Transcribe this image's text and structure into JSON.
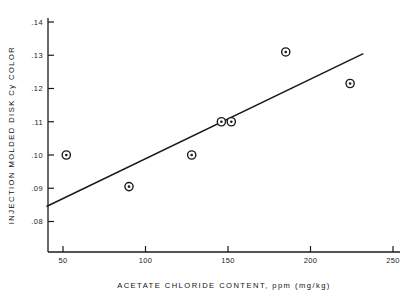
{
  "chart_data": {
    "type": "scatter",
    "title": "",
    "xlabel": "ACETATE CHLORIDE CONTENT, ppm (mg/kg)",
    "ylabel": "INJECTION MOLDED DISK Cy COLOR",
    "xlim": [
      38,
      258
    ],
    "ylim": [
      0.0735,
      0.1435
    ],
    "grid": false,
    "legend": null,
    "xticks": [
      50,
      100,
      150,
      200,
      250
    ],
    "xtick_labels": [
      "50",
      "100",
      "150",
      "200",
      "250"
    ],
    "yticks": [
      0.08,
      0.09,
      0.1,
      0.11,
      0.12,
      0.13,
      0.14
    ],
    "ytick_labels": [
      ".08",
      ".09",
      ".10",
      ".11",
      ".12",
      ".13",
      ".14"
    ],
    "series": [
      {
        "name": "measurements",
        "marker": "circle-dot",
        "x": [
          52,
          90,
          128,
          146,
          152,
          185,
          224
        ],
        "y": [
          0.1,
          0.0905,
          0.1,
          0.11,
          0.11,
          0.131,
          0.1215
        ]
      },
      {
        "name": "regression-line",
        "type": "line",
        "x": [
          40,
          232
        ],
        "y": [
          0.0845,
          0.1305
        ]
      }
    ]
  },
  "colors": {
    "axis": "#1a1a1a",
    "marker": "#1a1a1a",
    "line": "#1a1a1a",
    "background": "#ffffff"
  }
}
